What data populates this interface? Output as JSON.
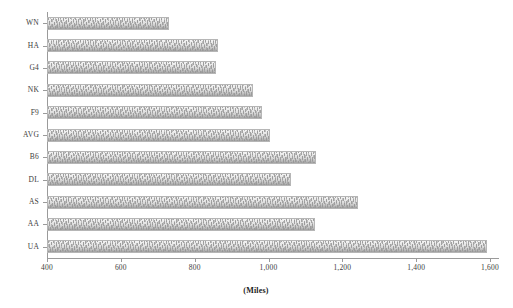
{
  "chart_data": {
    "type": "bar",
    "orientation": "horizontal",
    "title": "",
    "xlabel": "(Miles)",
    "ylabel": "",
    "xlim": [
      400,
      1600
    ],
    "x_ticks": [
      400,
      600,
      800,
      1000,
      1200,
      1400,
      1600
    ],
    "x_tick_labels": [
      "400",
      "600",
      "800",
      "1,000",
      "1,200",
      "1,400",
      "1,600"
    ],
    "grid": false,
    "legend": false,
    "categories": [
      "WN",
      "HA",
      "G4",
      "NK",
      "F9",
      "AVG",
      "B6",
      "DL",
      "AS",
      "AA",
      "UA"
    ],
    "values": [
      730,
      863,
      857,
      958,
      982,
      1005,
      1128,
      1061,
      1243,
      1126,
      1592
    ],
    "series": [
      {
        "name": "Average distance",
        "values": [
          730,
          863,
          857,
          958,
          982,
          1005,
          1128,
          1061,
          1243,
          1126,
          1592
        ]
      }
    ]
  },
  "axis": {
    "x_title": "(Miles)"
  },
  "style": {
    "bar_fill": "#dcdcdc",
    "bar_edge": "#b6b6b6",
    "axis_color": "#9a9a9a",
    "text_color": "#3c3c3c",
    "background": "#ffffff"
  }
}
